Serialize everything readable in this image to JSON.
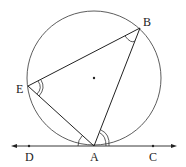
{
  "figure": {
    "type": "circle-geometry",
    "circle": {
      "cx": 94,
      "cy": 78,
      "r": 67,
      "center_marked": true
    },
    "points": [
      {
        "name": "B",
        "x": 140,
        "y": 28,
        "label": "B",
        "lx": 143,
        "ly": 25
      },
      {
        "name": "E",
        "x": 28,
        "y": 86,
        "label": "E",
        "lx": 16,
        "ly": 93
      },
      {
        "name": "A",
        "x": 94,
        "y": 146,
        "label": "A",
        "lx": 90,
        "ly": 161
      },
      {
        "name": "D",
        "x": 29,
        "y": 146,
        "label": "D",
        "lx": 24,
        "ly": 161
      },
      {
        "name": "C",
        "x": 153,
        "y": 146,
        "label": "C",
        "lx": 149,
        "ly": 161
      }
    ],
    "segments": [
      "EB",
      "BA",
      "AE"
    ],
    "tangent_line": {
      "from": "D",
      "to": "C",
      "arrows": "both"
    },
    "angle_marks": [
      {
        "at": "B",
        "arcs": 1,
        "between": [
          "E",
          "A"
        ]
      },
      {
        "at": "E",
        "arcs": 2,
        "between": [
          "B",
          "A"
        ]
      },
      {
        "at": "A",
        "arcs": 1,
        "between": [
          "E",
          "D"
        ]
      },
      {
        "at": "A",
        "arcs": 2,
        "between": [
          "B",
          "C"
        ]
      }
    ]
  }
}
